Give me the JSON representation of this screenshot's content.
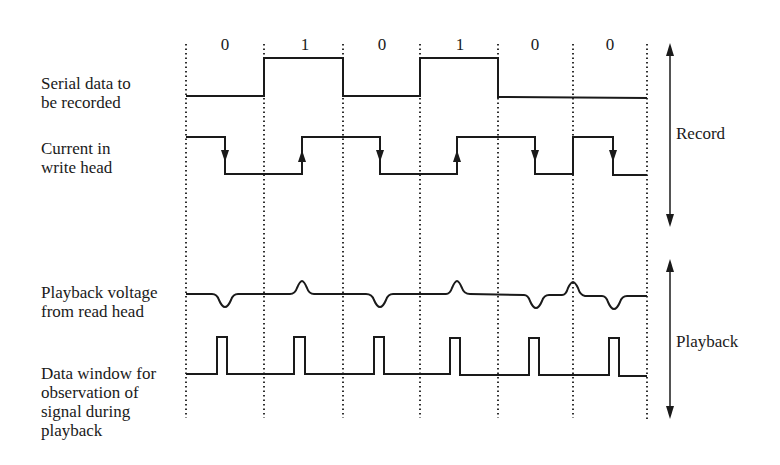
{
  "bits": [
    "0",
    "1",
    "0",
    "1",
    "0",
    "0"
  ],
  "signals": {
    "serial": {
      "label_line1": "Serial data to",
      "label_line2": "be recorded"
    },
    "current": {
      "label_line1": "Current in",
      "label_line2": "write head"
    },
    "playback": {
      "label_line1": "Playback voltage",
      "label_line2": "from read head"
    },
    "window": {
      "label_line1": "Data window for",
      "label_line2": "observation of",
      "label_line3": "signal during",
      "label_line4": "playback"
    }
  },
  "phases": {
    "record": "Record",
    "playback": "Playback"
  },
  "colors": {
    "ink": "#1a1a1a",
    "background": "#ffffff"
  }
}
